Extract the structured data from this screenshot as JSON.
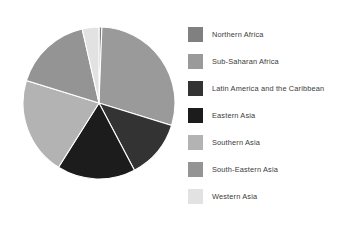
{
  "chart_data": {
    "type": "pie",
    "title": "",
    "subtitle": "",
    "xlabel": "",
    "ylabel": "",
    "grid": false,
    "legend_position": "right",
    "start_angle_deg": 0,
    "direction": "clockwise",
    "categories": [
      "Northern Africa",
      "Sub-Saharan Africa",
      "Latin America and the Caribbean",
      "Eastern Asia",
      "Southern Asia",
      "South-Eastern Asia",
      "Western Asia"
    ],
    "values": [
      0.6,
      29.2,
      12.5,
      16.7,
      20.8,
      16.7,
      3.5
    ],
    "colors": [
      "#808080",
      "#9a9a9a",
      "#333333",
      "#1c1c1c",
      "#b3b3b3",
      "#949494",
      "#e2e2e2"
    ],
    "slices": [
      {
        "label": "Northern Africa",
        "value": 0.6,
        "color": "#808080",
        "start_deg": 0,
        "end_deg": 2.2
      },
      {
        "label": "Sub-Saharan Africa",
        "value": 29.2,
        "color": "#9a9a9a",
        "start_deg": 2.2,
        "end_deg": 107.2
      },
      {
        "label": "Latin America and the Caribbean",
        "value": 12.5,
        "color": "#333333",
        "start_deg": 107.2,
        "end_deg": 152.2
      },
      {
        "label": "Eastern Asia",
        "value": 16.7,
        "color": "#1c1c1c",
        "start_deg": 152.2,
        "end_deg": 212.2
      },
      {
        "label": "Southern Asia",
        "value": 20.8,
        "color": "#b3b3b3",
        "start_deg": 212.2,
        "end_deg": 287.2
      },
      {
        "label": "South-Eastern Asia",
        "value": 16.7,
        "color": "#949494",
        "start_deg": 287.2,
        "end_deg": 347.2
      },
      {
        "label": "Western Asia",
        "value": 3.5,
        "color": "#e2e2e2",
        "start_deg": 347.2,
        "end_deg": 360
      }
    ]
  },
  "legend": {
    "items": [
      {
        "label": "Northern Africa",
        "color": "#808080"
      },
      {
        "label": "Sub-Saharan Africa",
        "color": "#9a9a9a"
      },
      {
        "label": "Latin America and the Caribbean",
        "color": "#333333"
      },
      {
        "label": "Eastern Asia",
        "color": "#1c1c1c"
      },
      {
        "label": "Southern Asia",
        "color": "#b3b3b3"
      },
      {
        "label": "South-Eastern Asia",
        "color": "#949494"
      },
      {
        "label": "Western Asia",
        "color": "#e2e2e2"
      }
    ]
  }
}
